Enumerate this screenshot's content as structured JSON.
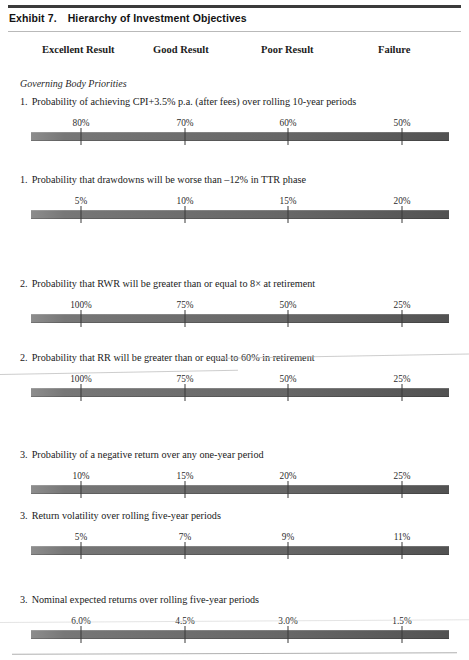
{
  "document": {
    "exhibit_number": "Exhibit 7.",
    "exhibit_title": "Hierarchy of Investment Objectives"
  },
  "column_headers": [
    {
      "label": "Excellent Result",
      "x": 42
    },
    {
      "label": "Good Result",
      "x": 153
    },
    {
      "label": "Poor Result",
      "x": 261
    },
    {
      "label": "Failure",
      "x": 378
    }
  ],
  "section_heading": "Governing Body Priorities",
  "scale_ticks_x": [
    81,
    185,
    288,
    402
  ],
  "items": [
    {
      "index": "1.",
      "text": "Probability of achieving CPI+3.5% p.a. (after fees) over rolling 10-year periods",
      "label_y": 96,
      "scale_y": 118,
      "values": [
        "80%",
        "70%",
        "60%",
        "50%"
      ]
    },
    {
      "index": "1.",
      "text": "Probability that drawdowns will be worse than –12% in TTR phase",
      "label_y": 174,
      "scale_y": 196,
      "values": [
        "5%",
        "10%",
        "15%",
        "20%"
      ]
    },
    {
      "index": "2.",
      "text": "Probability that RWR will be greater than or equal to 8× at retirement",
      "label_y": 278,
      "scale_y": 300,
      "values": [
        "100%",
        "75%",
        "50%",
        "25%"
      ]
    },
    {
      "index": "2.",
      "text": "Probability that RR will be greater than or equal to 60% in retirement",
      "label_y": 352,
      "scale_y": 374,
      "values": [
        "100%",
        "75%",
        "50%",
        "25%"
      ]
    },
    {
      "index": "3.",
      "text": "Probability of a negative return over any one-year period",
      "label_y": 449,
      "scale_y": 471,
      "values": [
        "10%",
        "15%",
        "20%",
        "25%"
      ]
    },
    {
      "index": "3.",
      "text": "Return volatility over rolling five-year periods",
      "label_y": 510,
      "scale_y": 532,
      "values": [
        "5%",
        "7%",
        "9%",
        "11%"
      ]
    },
    {
      "index": "3.",
      "text": "Nominal expected returns over rolling five-year periods",
      "label_y": 594,
      "scale_y": 616,
      "values": [
        "6.0%",
        "4.5%",
        "3.0%",
        "1.5%"
      ]
    }
  ],
  "section_heading_y": 78,
  "colors": {
    "rule_dark": "#3b3b3b",
    "rule_light": "#b9b9b9",
    "bar_light_end": "#8d8d8d",
    "bar_dark_end": "#525252",
    "text": "#1a1a1a"
  }
}
